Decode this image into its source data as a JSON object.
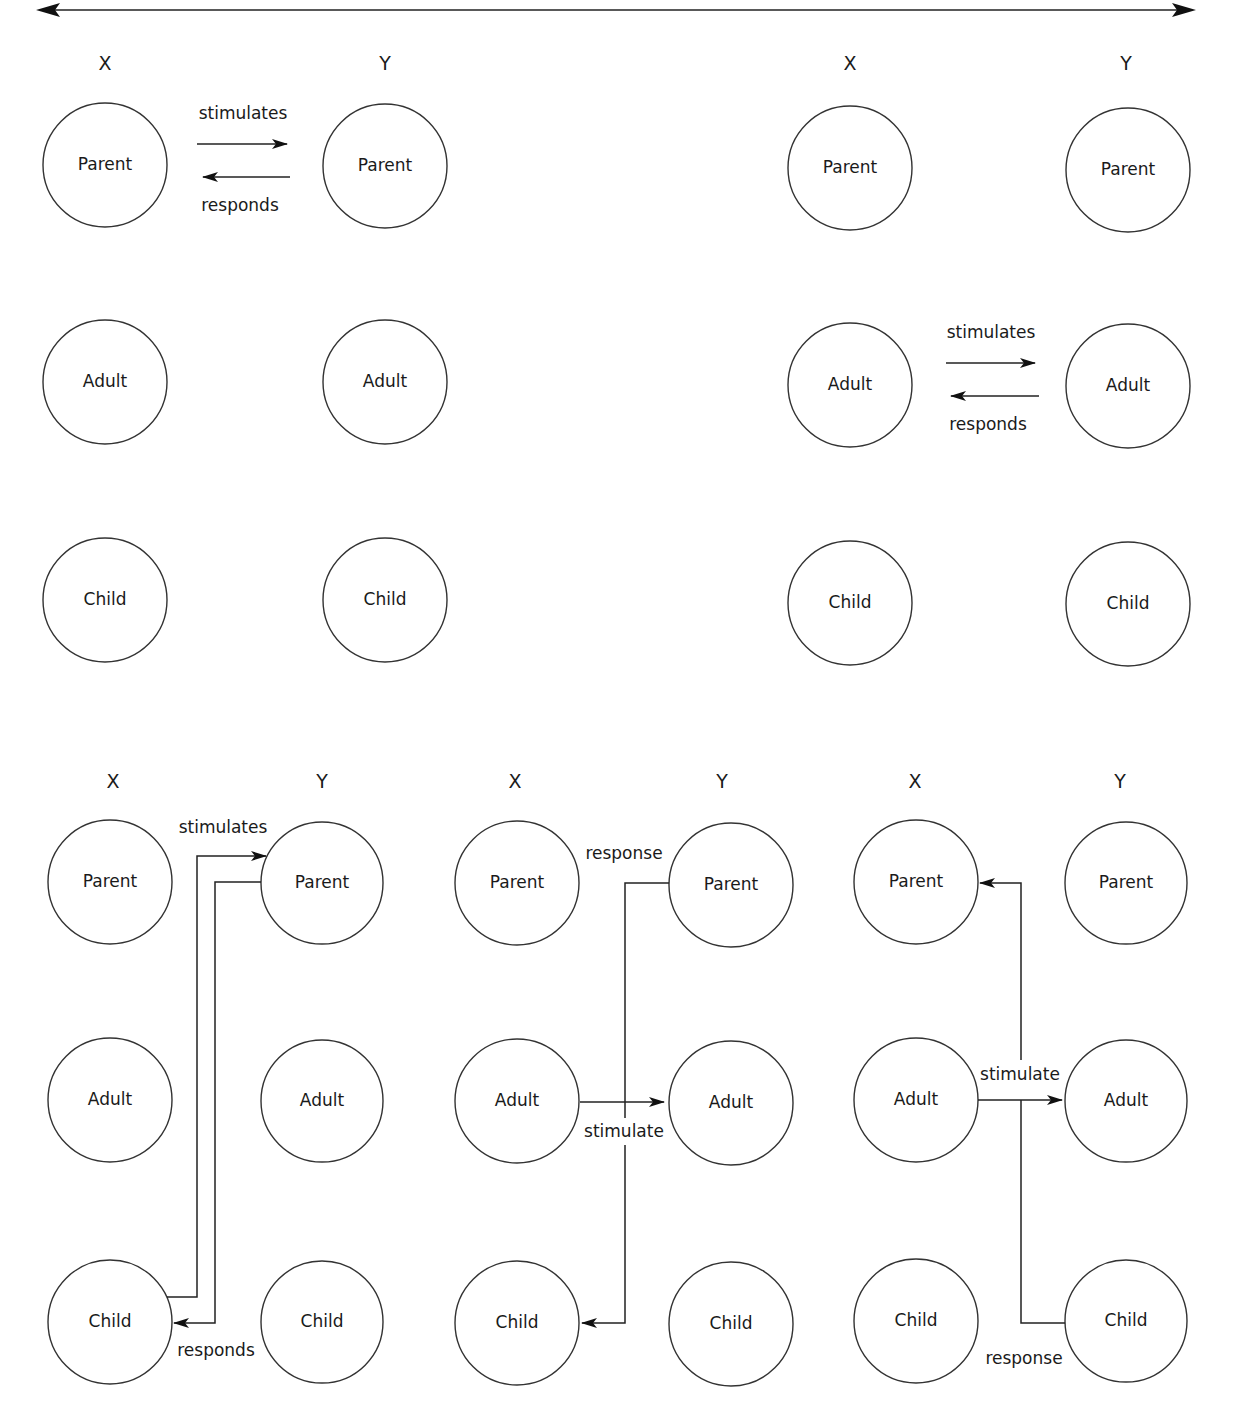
{
  "figure": {
    "type": "transactional-analysis-diagram",
    "scale_arrow": {
      "direction": "bidirectional",
      "label": ""
    }
  },
  "column_labels": {
    "x": "X",
    "y": "Y"
  },
  "ego_states": [
    "Parent",
    "Adult",
    "Child"
  ],
  "edge_words": {
    "stimulates": "stimulates",
    "responds": "responds",
    "stimulate": "stimulate",
    "response": "response"
  },
  "panels": [
    {
      "id": "top-left",
      "type": "complementary",
      "transactions": [
        {
          "from": "X.Parent",
          "to": "Y.Parent",
          "label": "stimulates"
        },
        {
          "from": "Y.Parent",
          "to": "X.Parent",
          "label": "responds"
        }
      ]
    },
    {
      "id": "top-right",
      "type": "complementary",
      "transactions": [
        {
          "from": "X.Adult",
          "to": "Y.Adult",
          "label": "stimulates"
        },
        {
          "from": "Y.Adult",
          "to": "X.Adult",
          "label": "responds"
        }
      ]
    },
    {
      "id": "bottom-left",
      "type": "complementary",
      "transactions": [
        {
          "from": "X.Child",
          "to": "Y.Parent",
          "label": "stimulates"
        },
        {
          "from": "Y.Parent",
          "to": "X.Child",
          "label": "responds"
        }
      ]
    },
    {
      "id": "bottom-middle",
      "type": "crossed",
      "transactions": [
        {
          "from": "X.Adult",
          "to": "Y.Adult",
          "label": "stimulate"
        },
        {
          "from": "Y.Parent",
          "to": "X.Child",
          "label": "response"
        }
      ]
    },
    {
      "id": "bottom-right",
      "type": "crossed",
      "transactions": [
        {
          "from": "X.Adult",
          "to": "Y.Adult",
          "label": "stimulate"
        },
        {
          "from": "Y.Child",
          "to": "X.Parent",
          "label": "response"
        }
      ]
    }
  ]
}
